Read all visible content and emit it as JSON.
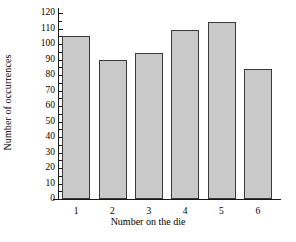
{
  "chart_data": {
    "type": "bar",
    "title": "",
    "xlabel": "Number on the die",
    "ylabel": "Number of occurrences",
    "categories": [
      "1",
      "2",
      "3",
      "4",
      "5",
      "6"
    ],
    "values": [
      105,
      90,
      94,
      109,
      114,
      84
    ],
    "series": [
      {
        "name": "Number of occurrences",
        "values": [
          105,
          90,
          94,
          109,
          114,
          84
        ]
      }
    ],
    "ylim": [
      0,
      120
    ],
    "ytick_step": 10,
    "yticks": [
      0,
      10,
      20,
      30,
      40,
      50,
      60,
      70,
      80,
      90,
      100,
      110,
      120
    ],
    "ytick_labels": [
      "0",
      "10",
      "20",
      "30",
      "40",
      "50",
      "60",
      "70",
      "80",
      "90",
      "100",
      "110",
      "120"
    ],
    "grid": false,
    "legend": false,
    "legend_position": "none",
    "bar_fill_color": "#c9c9c9",
    "bar_edge_color": "#3a3a3a",
    "axis_color": "#1a1a1a",
    "background_color": "#ffffff"
  }
}
